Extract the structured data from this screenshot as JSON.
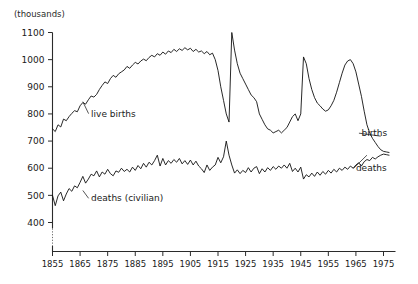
{
  "chart_data": {
    "type": "line",
    "title": "",
    "subtitle": "",
    "unit_label": "(thousands)",
    "xlabel": "",
    "ylabel": "",
    "xlim": [
      1855,
      1977
    ],
    "ylim": [
      380,
      1100
    ],
    "grid": false,
    "legend_position": "inline-annotations",
    "y_ticks": [
      1100,
      1000,
      900,
      800,
      700,
      600,
      500,
      400
    ],
    "x_ticks": [
      1855,
      1865,
      1875,
      1885,
      1895,
      1905,
      1915,
      1925,
      1935,
      1945,
      1955,
      1965,
      1975
    ],
    "axis_break_below": 400,
    "annotations": [
      {
        "name": "live-births-left",
        "text": "live births",
        "x_year": 1869,
        "y_value": 790,
        "anchor": "start",
        "leader_to_year": 1866,
        "leader_to_value": 845
      },
      {
        "name": "deaths-civilian-left",
        "text": "deaths (civilian)",
        "x_year": 1869,
        "y_value": 478,
        "anchor": "start",
        "leader_to_year": 1866,
        "leader_to_value": 518
      },
      {
        "name": "births-right",
        "text": "births",
        "x_year": 1967,
        "y_value": 718,
        "anchor": "start",
        "leader_to_year": 1974,
        "leader_to_value": 718
      },
      {
        "name": "deaths-right",
        "text": "deaths",
        "x_year": 1965,
        "y_value": 588,
        "anchor": "start",
        "leader_to_year": 1969,
        "leader_to_value": 648
      }
    ],
    "series": [
      {
        "name": "live births",
        "color": "#111111",
        "x": [
          1855,
          1856,
          1857,
          1858,
          1859,
          1860,
          1861,
          1862,
          1863,
          1864,
          1865,
          1866,
          1867,
          1868,
          1869,
          1870,
          1871,
          1872,
          1873,
          1874,
          1875,
          1876,
          1877,
          1878,
          1879,
          1880,
          1881,
          1882,
          1883,
          1884,
          1885,
          1886,
          1887,
          1888,
          1889,
          1890,
          1891,
          1892,
          1893,
          1894,
          1895,
          1896,
          1897,
          1898,
          1899,
          1900,
          1901,
          1902,
          1903,
          1904,
          1905,
          1906,
          1907,
          1908,
          1909,
          1910,
          1911,
          1912,
          1913,
          1914,
          1915,
          1916,
          1917,
          1918,
          1919,
          1920,
          1921,
          1922,
          1923,
          1924,
          1925,
          1926,
          1927,
          1928,
          1929,
          1930,
          1931,
          1932,
          1933,
          1934,
          1935,
          1936,
          1937,
          1938,
          1939,
          1940,
          1941,
          1942,
          1943,
          1944,
          1945,
          1946,
          1947,
          1948,
          1949,
          1950,
          1951,
          1952,
          1953,
          1954,
          1955,
          1956,
          1957,
          1958,
          1959,
          1960,
          1961,
          1962,
          1963,
          1964,
          1965,
          1966,
          1967,
          1968,
          1969,
          1970,
          1971,
          1972,
          1973,
          1974,
          1975,
          1976,
          1977
        ],
        "values": [
          745,
          735,
          760,
          752,
          781,
          775,
          790,
          802,
          812,
          808,
          830,
          842,
          836,
          852,
          866,
          862,
          872,
          890,
          905,
          918,
          912,
          930,
          942,
          935,
          948,
          955,
          962,
          975,
          968,
          980,
          990,
          984,
          995,
          1002,
          996,
          1008,
          1016,
          1010,
          1022,
          1016,
          1028,
          1020,
          1032,
          1026,
          1038,
          1030,
          1040,
          1034,
          1044,
          1036,
          1042,
          1030,
          1038,
          1028,
          1032,
          1022,
          1030,
          1018,
          1024,
          1000,
          960,
          900,
          850,
          800,
          770,
          1100,
          1035,
          985,
          950,
          930,
          910,
          890,
          870,
          860,
          845,
          800,
          780,
          760,
          745,
          740,
          730,
          735,
          740,
          730,
          740,
          750,
          770,
          790,
          800,
          775,
          800,
          1010,
          985,
          930,
          890,
          860,
          840,
          830,
          818,
          810,
          815,
          830,
          850,
          880,
          915,
          950,
          980,
          995,
          1000,
          985,
          955,
          910,
          865,
          810,
          760,
          730,
          710,
          695,
          680,
          668,
          662,
          660,
          658
        ]
      },
      {
        "name": "deaths (civilian)",
        "color": "#111111",
        "x": [
          1855,
          1856,
          1857,
          1858,
          1859,
          1860,
          1861,
          1862,
          1863,
          1864,
          1865,
          1866,
          1867,
          1868,
          1869,
          1870,
          1871,
          1872,
          1873,
          1874,
          1875,
          1876,
          1877,
          1878,
          1879,
          1880,
          1881,
          1882,
          1883,
          1884,
          1885,
          1886,
          1887,
          1888,
          1889,
          1890,
          1891,
          1892,
          1893,
          1894,
          1895,
          1896,
          1897,
          1898,
          1899,
          1900,
          1901,
          1902,
          1903,
          1904,
          1905,
          1906,
          1907,
          1908,
          1909,
          1910,
          1911,
          1912,
          1913,
          1914,
          1915,
          1916,
          1917,
          1918,
          1919,
          1920,
          1921,
          1922,
          1923,
          1924,
          1925,
          1926,
          1927,
          1928,
          1929,
          1930,
          1931,
          1932,
          1933,
          1934,
          1935,
          1936,
          1937,
          1938,
          1939,
          1940,
          1941,
          1942,
          1943,
          1944,
          1945,
          1946,
          1947,
          1948,
          1949,
          1950,
          1951,
          1952,
          1953,
          1954,
          1955,
          1956,
          1957,
          1958,
          1959,
          1960,
          1961,
          1962,
          1963,
          1964,
          1965,
          1966,
          1967,
          1968,
          1969,
          1970,
          1971,
          1972,
          1973,
          1974,
          1975,
          1976,
          1977
        ],
        "values": [
          500,
          462,
          498,
          512,
          480,
          505,
          525,
          515,
          535,
          528,
          548,
          570,
          545,
          560,
          578,
          572,
          590,
          568,
          586,
          578,
          596,
          580,
          572,
          590,
          585,
          600,
          588,
          596,
          586,
          604,
          592,
          610,
          598,
          618,
          604,
          622,
          612,
          628,
          648,
          608,
          636,
          612,
          628,
          618,
          632,
          622,
          636,
          616,
          628,
          614,
          630,
          612,
          626,
          608,
          598,
          584,
          612,
          592,
          604,
          612,
          640,
          620,
          642,
          700,
          648,
          612,
          582,
          594,
          580,
          592,
          584,
          602,
          586,
          600,
          606,
          580,
          598,
          586,
          602,
          592,
          606,
          596,
          608,
          600,
          612,
          600,
          618,
          588,
          600,
          586,
          604,
          560,
          576,
          568,
          582,
          570,
          586,
          574,
          588,
          578,
          592,
          582,
          596,
          586,
          600,
          592,
          604,
          596,
          608,
          600,
          612,
          620,
          608,
          624,
          632,
          628,
          640,
          634,
          642,
          648,
          652,
          650,
          648
        ]
      }
    ]
  }
}
